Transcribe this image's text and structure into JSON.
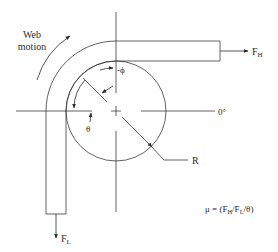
{
  "diagram": {
    "labels": {
      "web_motion_line1": "Web",
      "web_motion_line2": "motion",
      "force_high": "F",
      "force_high_sub": "H",
      "force_low": "F",
      "force_low_sub": "L",
      "phi": "-ϕ",
      "theta": "θ",
      "zero_degree": "0°",
      "radius": "R",
      "formula_prefix": "μ = (F",
      "formula_sub_h": "H",
      "formula_mid": "/F",
      "formula_sub_l": "L",
      "formula_suffix": "/θ)"
    },
    "colors": {
      "stroke": "#3a3a3a",
      "text": "#2a2a2a",
      "background": "#ffffff"
    }
  }
}
